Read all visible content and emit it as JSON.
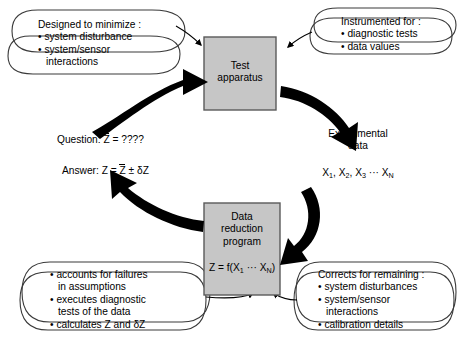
{
  "diagram": {
    "colors": {
      "box_fill": "#c6c6c6",
      "box_stroke": "#5a5a5a",
      "arrow": "#000000",
      "callout_stroke": "#3a3a3a",
      "text": "#000000",
      "background": "#ffffff"
    }
  },
  "boxes": {
    "test_apparatus": {
      "line1": "Test",
      "line2": "apparatus"
    },
    "data_reduction": {
      "line1": "Data",
      "line2": "reduction",
      "line3": "program",
      "formula_prefix": "Z = f(X",
      "formula_sub1": "1",
      "formula_mid": " ··· X",
      "formula_sub2": "N",
      "formula_suffix": ")"
    }
  },
  "callouts": {
    "top_left": {
      "heading": "Designed to minimize :",
      "bullets": [
        "system disturbance",
        "system/sensor"
      ],
      "continuation": "interactions"
    },
    "top_right": {
      "heading": "Instrumented for :",
      "bullets": [
        "diagnostic tests",
        "data values"
      ]
    },
    "bottom_left": {
      "bullets": [
        "accounts for failures",
        "executes diagnostic",
        "calculates Z and δZ"
      ],
      "continuations": [
        "in assumptions",
        "tests of the data"
      ]
    },
    "bottom_right": {
      "heading": "Corrects for remaining :",
      "bullets": [
        "system disturbances",
        "system/sensor",
        "calibration details"
      ],
      "continuation": "interactions"
    }
  },
  "labels": {
    "question": "Question:  Z̅ = ????",
    "question_prefix": "Question: ",
    "question_var": "Z",
    "question_rest": " = ????",
    "answer_prefix": "Answer:  Z = ",
    "answer_var": "Z",
    "answer_rest": " ± δZ",
    "experimental_line1": "Experimental",
    "experimental_line2": "data",
    "data_values_prefix": "X",
    "data_values": "X1, X2, X3 ··· XN"
  },
  "arrows": {
    "left_up": "question-to-test-apparatus",
    "right_down": "test-apparatus-to-experimental-data",
    "bottom_left_up": "data-reduction-to-answer",
    "bottom_right_in": "experimental-data-to-data-reduction"
  }
}
